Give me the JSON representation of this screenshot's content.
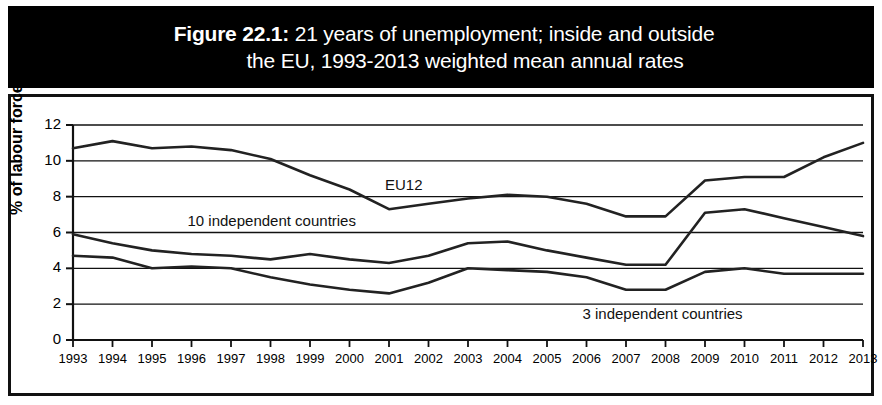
{
  "title": {
    "figure_label": "Figure 22.1:",
    "line1_rest": " 21 years of unemployment; inside and outside",
    "line2": "the EU, 1993-2013 weighted mean annual rates"
  },
  "chart_data": {
    "type": "line",
    "title": "Figure 22.1: 21 years of unemployment; inside and outside the EU, 1993-2013 weighted mean annual rates",
    "xlabel": "",
    "ylabel": "% of labour force",
    "ylim": [
      0,
      12
    ],
    "ytick_labels": [
      "0",
      "2",
      "4",
      "6",
      "8",
      "10",
      "12"
    ],
    "yticks": [
      0,
      2,
      4,
      6,
      8,
      10,
      12
    ],
    "grid": true,
    "legend": "inline-labels",
    "categories": [
      "1993",
      "1994",
      "1995",
      "1996",
      "1997",
      "1998",
      "1999",
      "2000",
      "2001",
      "2002",
      "2003",
      "2004",
      "2005",
      "2006",
      "2007",
      "2008",
      "2009",
      "2010",
      "2011",
      "2012",
      "2013"
    ],
    "series": [
      {
        "name": "EU12",
        "label": "EU12",
        "color": "#222222",
        "values": [
          10.7,
          11.1,
          10.7,
          10.8,
          10.6,
          10.1,
          9.2,
          8.4,
          7.3,
          7.6,
          7.9,
          8.1,
          8.0,
          7.6,
          6.9,
          6.9,
          8.9,
          9.1,
          9.1,
          10.2,
          11.0
        ]
      },
      {
        "name": "10 independent countries",
        "label": "10 independent countries",
        "color": "#222222",
        "values": [
          5.9,
          5.4,
          5.0,
          4.8,
          4.7,
          4.5,
          4.8,
          4.5,
          4.3,
          4.7,
          5.4,
          5.5,
          5.0,
          4.6,
          4.2,
          4.2,
          7.1,
          7.3,
          6.8,
          6.3,
          5.8
        ]
      },
      {
        "name": "3 independent countries",
        "label": "3 independent countries",
        "color": "#222222",
        "values": [
          4.7,
          4.6,
          4.0,
          4.1,
          4.0,
          3.5,
          3.1,
          2.8,
          2.6,
          3.2,
          4.0,
          3.9,
          3.8,
          3.5,
          2.8,
          2.8,
          3.8,
          4.0,
          3.7,
          3.7,
          3.7
        ]
      }
    ],
    "annotations": [
      {
        "text": "EU12",
        "near_year": 2001,
        "near_value": 8.6
      },
      {
        "text": "10 independent countries",
        "near_year": 1996,
        "near_value": 6.6
      },
      {
        "text": "3 independent countries",
        "near_year": 2006,
        "near_value": 1.4
      }
    ]
  }
}
